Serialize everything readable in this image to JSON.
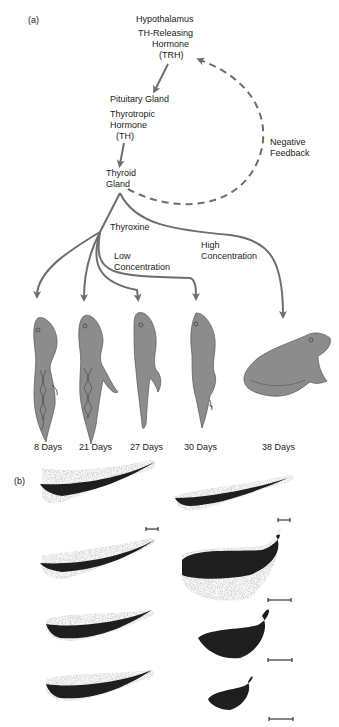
{
  "panel_a": {
    "label": "(a)",
    "hypothalamus": "Hypothalamus",
    "trh_line1": "TH-Releasing",
    "trh_line2": "Hormone",
    "trh_line3": "(TRH)",
    "pituitary": "Pituitary Gland",
    "th_line1": "Thyrotropic",
    "th_line2": "Hormone",
    "th_line3": "(TH)",
    "thyroid_line1": "Thyroid",
    "thyroid_line2": "Gland",
    "feedback_line1": "Negative",
    "feedback_line2": "Feedback",
    "thyroxine": "Thyroxine",
    "low_line1": "Low",
    "low_line2": "Concentration",
    "high_line1": "High",
    "high_line2": "Concentration",
    "stages": [
      {
        "label": "8 Days"
      },
      {
        "label": "21 Days"
      },
      {
        "label": "27 Days"
      },
      {
        "label": "30 Days"
      },
      {
        "label": "38 Days"
      }
    ]
  },
  "panel_b": {
    "label": "(b)"
  },
  "colors": {
    "arrow": "#6e6e6e",
    "animal_fill": "#8c8c8c",
    "text": "#1a1a1a",
    "tail_dark": "#1e1e1e"
  }
}
